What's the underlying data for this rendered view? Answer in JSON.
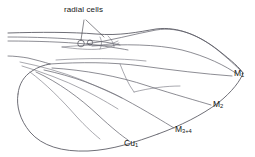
{
  "figure": {
    "type": "line-diagram",
    "background_color": "#ffffff",
    "line_color": "#5c5c66",
    "text_color": "#151515"
  },
  "annotations": {
    "radial_cells": {
      "text": "radial cells",
      "leader_lines": 2,
      "points_to": "two small radial cells near wing base"
    }
  },
  "vein_labels": [
    {
      "id": "m1",
      "base": "M",
      "subscript": "1",
      "text": "M1"
    },
    {
      "id": "m2",
      "base": "M",
      "subscript": "2",
      "text": "M2"
    },
    {
      "id": "m34",
      "base": "M",
      "subscript": "3+4",
      "text": "M3+4"
    },
    {
      "id": "cu1",
      "base": "Cu",
      "subscript": "1",
      "text": "Cu1"
    }
  ]
}
